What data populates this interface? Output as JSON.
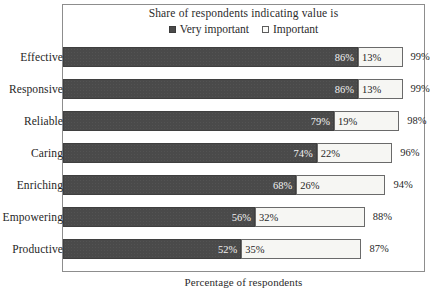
{
  "chart_data": {
    "type": "bar",
    "orientation": "horizontal",
    "stacked": true,
    "title": "Share of respondents indicating value is",
    "xlabel": "Percentage of respondents",
    "ylabel": "",
    "xlim": [
      0,
      100
    ],
    "grid": false,
    "legend_position": "top-center",
    "categories": [
      "Effective",
      "Responsive",
      "Reliable",
      "Caring",
      "Enriching",
      "Empowering",
      "Productive"
    ],
    "series": [
      {
        "name": "Very important",
        "color": "#4a4a4a",
        "values": [
          86,
          86,
          79,
          74,
          68,
          56,
          52
        ],
        "labels": [
          "86%",
          "86%",
          "79%",
          "74%",
          "68%",
          "56%",
          "52%"
        ]
      },
      {
        "name": "Important",
        "color": "#f6f6f3",
        "values": [
          13,
          13,
          19,
          22,
          26,
          32,
          35
        ],
        "labels": [
          "13%",
          "13%",
          "19%",
          "22%",
          "26%",
          "32%",
          "35%"
        ]
      }
    ],
    "totals": [
      99,
      99,
      98,
      96,
      94,
      88,
      87
    ],
    "total_labels": [
      "99%",
      "99%",
      "98%",
      "96%",
      "94%",
      "88%",
      "87%"
    ]
  },
  "legend": {
    "title": "Share of respondents indicating value is",
    "entries": [
      {
        "label": "Very important",
        "swatch": "filled-square-icon"
      },
      {
        "label": "Important",
        "swatch": "open-square-icon"
      }
    ]
  },
  "axis": {
    "x_caption": "Percentage of respondents"
  },
  "colors": {
    "very_important": "#4a4a4a",
    "important": "#f6f6f3",
    "frame": "#8d8d8d",
    "text": "#1f1f1f",
    "background": "#ffffff"
  }
}
